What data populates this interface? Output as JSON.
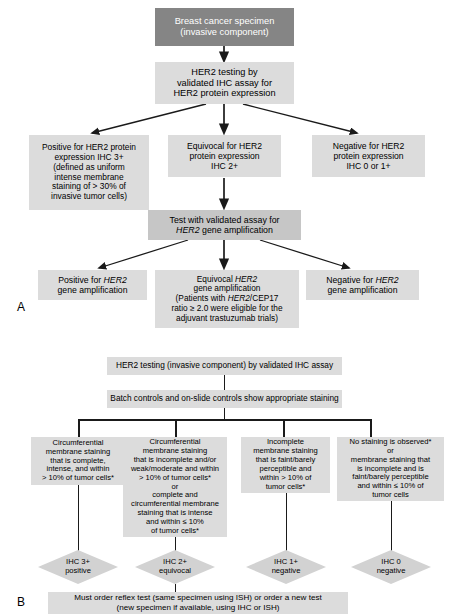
{
  "figure": {
    "panel_a_label": "A",
    "panel_b_label": "B"
  },
  "panel_a": {
    "nodes": {
      "specimen": "Breast cancer specimen\n(invasive component)",
      "ihc_testing": "HER2 testing by\nvalidated IHC assay for\nHER2 protein expression",
      "ihc_positive": "Positive for HER2 protein\nexpression IHC 3+\n(defined as uniform\nintense membrane\nstaining of > 30% of\ninvasive tumor cells)",
      "ihc_equivocal": "Equivocal for HER2\nprotein expression\nIHC 2+",
      "ihc_negative": "Negative for HER2\nprotein expression\nIHC 0 or 1+",
      "gene_test_line1": "Test with validated assay for",
      "gene_test_line2_italic": "HER2",
      "gene_test_line2_rest": " gene amplification",
      "gene_positive_line1": "Positive for ",
      "gene_positive_italic": "HER2",
      "gene_positive_line2": "gene amplification",
      "gene_equivocal_line1": "Equivocal ",
      "gene_equivocal_italic1": "HER2",
      "gene_equivocal_line2": "gene amplification",
      "gene_equivocal_line3a": "(Patients with ",
      "gene_equivocal_italic2": "HER2",
      "gene_equivocal_line3b": "/CEP17",
      "gene_equivocal_line4": "ratio ≥ 2.0 were eligible for the",
      "gene_equivocal_line5": "adjuvant trastuzumab trials)",
      "gene_negative_line1": "Negative for ",
      "gene_negative_italic": "HER2",
      "gene_negative_line2": "gene amplification"
    }
  },
  "panel_b": {
    "nodes": {
      "ihc_testing": "HER2 testing (invasive component) by validated IHC assay",
      "batch_controls": "Batch controls and on-slide controls show appropriate staining",
      "criteria_1": "Circumferential\nmembrane staining\nthat is complete,\nintense, and within\n> 10% of tumor cells*",
      "criteria_2": "Circumferential\nmembrane staining\nthat is incomplete and/or\nweak/moderate and within\n> 10% of tumor cells*\nor\ncomplete and\ncircumferential membrane\nstaining that is intense\nand within ≤ 10%\nof tumor cells*",
      "criteria_3": "Incomplete\nmembrane staining\nthat is faint/barely\nperceptible and\nwithin > 10% of\ntumor cells*",
      "criteria_4": "No staining is observed*\nor\nmembrane staining that\nis incomplete and is\nfaint/barely perceptible\nand within ≤ 10% of\ntumor cells",
      "result_1": "IHC 3+\npositive",
      "result_2": "IHC 2+\nequivocal",
      "result_3": "IHC 1+\nnegative",
      "result_4": "IHC 0\nnegative",
      "reflex_test": "Must order reflex test (same specimen using ISH) or order a new test\n(new specimen if available, using IHC or ISH)"
    }
  },
  "colors": {
    "dark_box": "#858585",
    "mid_box": "#c6c6c6",
    "light_box": "#dcdcdc",
    "diamond": "#d2d2d2",
    "line": "#1a1a1a",
    "background": "#ffffff"
  }
}
